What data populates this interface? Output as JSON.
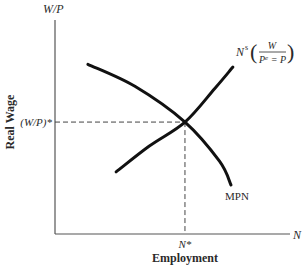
{
  "chart_data": {
    "type": "line",
    "title": "",
    "xlabel": "Employment",
    "ylabel": "Real Wage",
    "x_axis_symbol": "N",
    "y_axis_symbol": "W/P",
    "xlim": [
      0,
      1
    ],
    "ylim": [
      0,
      1
    ],
    "grid": false,
    "equilibrium": {
      "x": 0.553,
      "y": 0.523,
      "x_label": "N*",
      "y_label": "(W/P)*"
    },
    "series": [
      {
        "name": "MPN",
        "label": "MPN",
        "description": "labor demand (downward sloping)",
        "points": [
          [
            0.14,
            0.793
          ],
          [
            0.34,
            0.69
          ],
          [
            0.553,
            0.523
          ],
          [
            0.7,
            0.34
          ],
          [
            0.749,
            0.229
          ]
        ]
      },
      {
        "name": "Ns",
        "label_main": "N",
        "label_sup": "s",
        "label_frac_num": "W",
        "label_frac_den_base": "P",
        "label_frac_den_sup": "e",
        "label_frac_den_rest": " = P",
        "description": "labor supply (upward sloping)",
        "points": [
          [
            0.26,
            0.29
          ],
          [
            0.4,
            0.41
          ],
          [
            0.553,
            0.523
          ],
          [
            0.68,
            0.68
          ],
          [
            0.757,
            0.78
          ]
        ]
      }
    ]
  }
}
